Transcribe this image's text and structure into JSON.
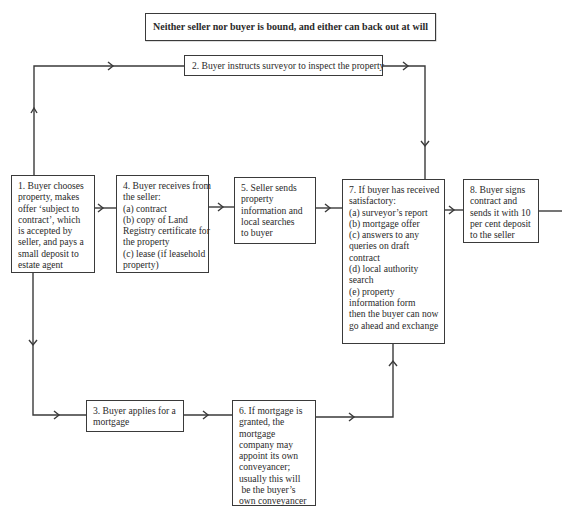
{
  "diagram": {
    "header": "Neither seller nor buyer is bound, and either can back out at will",
    "steps": [
      {
        "id": 1,
        "lines": [
          "1. Buyer chooses",
          "property, makes",
          "offer ‘subject to",
          "contract’, which",
          "is accepted by",
          "seller, and pays a",
          "small deposit to",
          "estate agent"
        ]
      },
      {
        "id": 2,
        "lines": [
          "2. Buyer instructs surveyor to inspect the property"
        ]
      },
      {
        "id": 3,
        "lines": [
          "3. Buyer applies for a",
          "mortgage"
        ]
      },
      {
        "id": 4,
        "lines": [
          "4. Buyer receives from",
          "the seller:",
          "(a) contract",
          "(b) copy of Land",
          "Registry certificate for",
          "the property",
          "(c) lease (if leasehold",
          "property)"
        ]
      },
      {
        "id": 5,
        "lines": [
          "5. Seller sends",
          "property",
          "information and",
          "local searches",
          "to buyer"
        ]
      },
      {
        "id": 6,
        "lines": [
          "6. If mortgage is",
          "granted, the",
          "mortgage",
          "company may",
          "appoint its own",
          "conveyancer;",
          "usually this will",
          " be the buyer’s",
          "own conveyancer"
        ]
      },
      {
        "id": 7,
        "lines": [
          "7. If buyer has received",
          "satisfactory:",
          "(a) surveyor’s report",
          "(b) mortgage offer",
          "(c) answers to any",
          "queries on draft",
          "contract",
          "(d) local authority",
          "search",
          "(e) property",
          "information form",
          "then the buyer can now",
          "go ahead and exchange"
        ]
      },
      {
        "id": 8,
        "lines": [
          "8. Buyer signs",
          "contract and",
          "sends it with 10",
          "per cent deposit",
          "to the seller"
        ]
      }
    ],
    "connections": [
      {
        "from": 1,
        "to": 2,
        "direction": "up then right"
      },
      {
        "from": 1,
        "to": 4,
        "direction": "right"
      },
      {
        "from": 1,
        "to": 3,
        "direction": "down then right"
      },
      {
        "from": 4,
        "to": 5,
        "direction": "right"
      },
      {
        "from": 5,
        "to": 7,
        "direction": "right"
      },
      {
        "from": 2,
        "to": 7,
        "direction": "right then down"
      },
      {
        "from": 3,
        "to": 6,
        "direction": "right"
      },
      {
        "from": 6,
        "to": 7,
        "direction": "right then up"
      },
      {
        "from": 7,
        "to": 8,
        "direction": "right"
      },
      {
        "from": 8,
        "to": "continues",
        "direction": "right"
      }
    ],
    "colors": {
      "line": "#3a3a3a",
      "text": "#2a2a2a",
      "background": "#ffffff"
    }
  }
}
